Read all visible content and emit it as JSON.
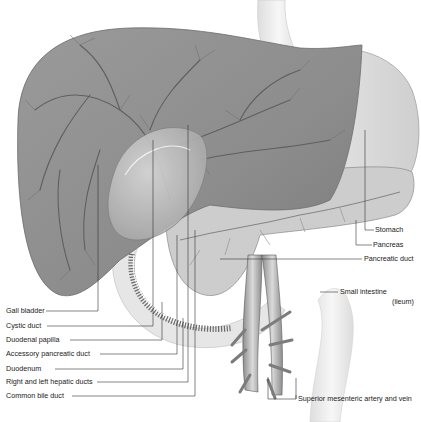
{
  "figure": {
    "colors": {
      "background": "#ffffff",
      "liver": "#8a8a8a",
      "liver_light": "#a9a9a9",
      "vessel": "#5e5e5e",
      "stomach": "#dcdcdc",
      "pancreas": "#c8c8c8",
      "intestine": "#eeeeee",
      "leader_line": "#333333",
      "label_text": "#222222"
    },
    "labels_left": [
      {
        "id": "gall-bladder",
        "text": "Gall bladder"
      },
      {
        "id": "cystic-duct",
        "text": "Cystic duct"
      },
      {
        "id": "duodenal-papilla",
        "text": "Duodenal papilla"
      },
      {
        "id": "accessory-pancreatic-duct",
        "text": "Accessory pancreatic duct"
      },
      {
        "id": "duodenum",
        "text": "Duodenum"
      },
      {
        "id": "right-left-hepatic-ducts",
        "text": "Right and left hepatic ducts"
      },
      {
        "id": "common-bile-duct",
        "text": "Common bile duct"
      }
    ],
    "labels_right": [
      {
        "id": "stomach",
        "text": "Stomach"
      },
      {
        "id": "pancreas",
        "text": "Pancreas"
      },
      {
        "id": "pancreatic-duct",
        "text": "Pancreatic duct"
      },
      {
        "id": "small-intestine",
        "text": "Small intestine"
      },
      {
        "id": "small-intestine-sub",
        "text": "(ileum)"
      },
      {
        "id": "superior-mesenteric",
        "text": "Superior mesenteric artery and vein"
      }
    ]
  }
}
